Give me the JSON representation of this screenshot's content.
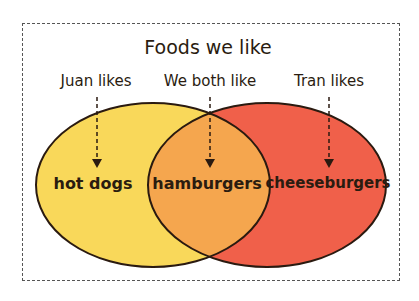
{
  "title": "Foods we like",
  "labels": {
    "left": "Juan likes",
    "middle": "We both like",
    "right": "Tran likes"
  },
  "items": {
    "left_only": "hot dogs",
    "both": "hamburgers",
    "right_only": "cheeseburgers"
  },
  "colors": {
    "left_set": "#f9d85a",
    "right_set": "#f0604a",
    "overlap": "#f5a64e",
    "outline": "#2a1a10"
  }
}
